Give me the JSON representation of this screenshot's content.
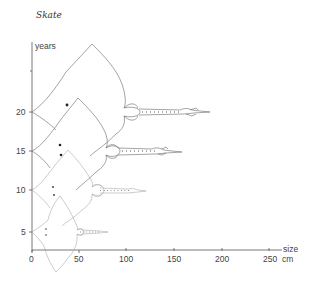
{
  "title": "Skate",
  "y_axis": {
    "label": "years",
    "ticks": [
      {
        "label": "5",
        "value": 5
      },
      {
        "label": "10",
        "value": 10
      },
      {
        "label": "15",
        "value": 15
      },
      {
        "label": "20",
        "value": 20
      }
    ]
  },
  "x_axis": {
    "label": "size",
    "unit": "cm",
    "ticks": [
      {
        "label": "0",
        "value": 0
      },
      {
        "label": "50",
        "value": 50
      },
      {
        "label": "100",
        "value": 100
      },
      {
        "label": "150",
        "value": 150
      },
      {
        "label": "200",
        "value": 200
      },
      {
        "label": "250",
        "value": 250
      }
    ]
  },
  "skates": [
    {
      "age_years": 5,
      "length_cm": 80
    },
    {
      "age_years": 10,
      "length_cm": 125
    },
    {
      "age_years": 15,
      "length_cm": 165
    },
    {
      "age_years": 20,
      "length_cm": 205
    }
  ],
  "colors": {
    "line": "#666666",
    "text": "#444444",
    "background": "#ffffff"
  }
}
